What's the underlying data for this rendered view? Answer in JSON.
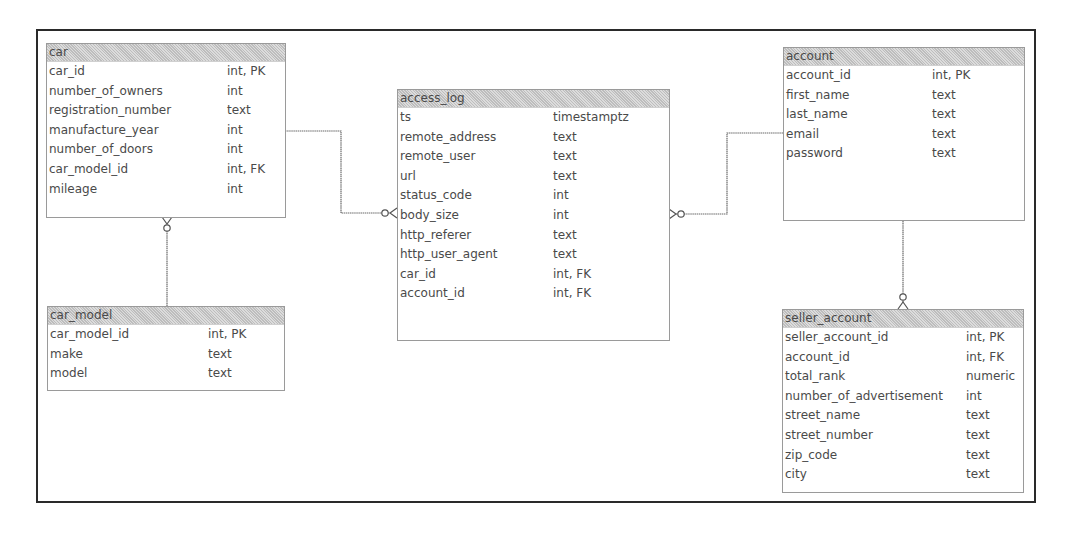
{
  "diagram": {
    "type": "entity-relationship",
    "entities": {
      "car": {
        "name": "car",
        "columns": [
          {
            "name": "car_id",
            "type": "int, PK"
          },
          {
            "name": "number_of_owners",
            "type": "int"
          },
          {
            "name": "registration_number",
            "type": "text"
          },
          {
            "name": "manufacture_year",
            "type": "int"
          },
          {
            "name": "number_of_doors",
            "type": "int"
          },
          {
            "name": "car_model_id",
            "type": "int, FK"
          },
          {
            "name": "mileage",
            "type": "int"
          }
        ]
      },
      "car_model": {
        "name": "car_model",
        "columns": [
          {
            "name": "car_model_id",
            "type": "int, PK"
          },
          {
            "name": "make",
            "type": "text"
          },
          {
            "name": "model",
            "type": "text"
          }
        ]
      },
      "access_log": {
        "name": "access_log",
        "columns": [
          {
            "name": "ts",
            "type": "timestamptz"
          },
          {
            "name": "remote_address",
            "type": "text"
          },
          {
            "name": "remote_user",
            "type": "text"
          },
          {
            "name": "url",
            "type": "text"
          },
          {
            "name": "status_code",
            "type": "int"
          },
          {
            "name": "body_size",
            "type": "int"
          },
          {
            "name": "http_referer",
            "type": "text"
          },
          {
            "name": "http_user_agent",
            "type": "text"
          },
          {
            "name": "car_id",
            "type": "int, FK"
          },
          {
            "name": "account_id",
            "type": "int, FK"
          }
        ]
      },
      "account": {
        "name": "account",
        "columns": [
          {
            "name": "account_id",
            "type": "int, PK"
          },
          {
            "name": "first_name",
            "type": "text"
          },
          {
            "name": "last_name",
            "type": "text"
          },
          {
            "name": "email",
            "type": "text"
          },
          {
            "name": "password",
            "type": "text"
          }
        ]
      },
      "seller_account": {
        "name": "seller_account",
        "columns": [
          {
            "name": "seller_account_id",
            "type": "int, PK"
          },
          {
            "name": "account_id",
            "type": "int, FK"
          },
          {
            "name": "total_rank",
            "type": "numeric"
          },
          {
            "name": "number_of_advertisement",
            "type": "int"
          },
          {
            "name": "street_name",
            "type": "text"
          },
          {
            "name": "street_number",
            "type": "text"
          },
          {
            "name": "zip_code",
            "type": "text"
          },
          {
            "name": "city",
            "type": "text"
          }
        ]
      }
    },
    "relationships": [
      {
        "from": "car_model",
        "to": "car",
        "cardinality": "one-to-zero-or-many"
      },
      {
        "from": "car",
        "to": "access_log",
        "cardinality": "one-to-zero-or-many"
      },
      {
        "from": "account",
        "to": "access_log",
        "cardinality": "one-to-zero-or-many"
      },
      {
        "from": "account",
        "to": "seller_account",
        "cardinality": "one-to-zero-or-many"
      }
    ],
    "colors": {
      "frame_border": "#2a2a2a",
      "entity_border": "#6a6a6a",
      "header_fill": "#cfcfcf",
      "text": "#4a4a4a"
    }
  }
}
